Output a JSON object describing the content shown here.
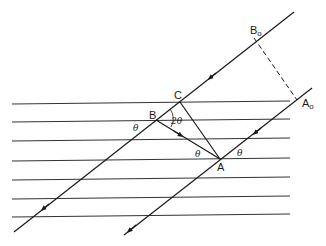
{
  "diagram": {
    "title": "",
    "points": {
      "A": {
        "label": "A",
        "x": 220,
        "y": 159
      },
      "B": {
        "label": "B",
        "x": 156,
        "y": 120
      },
      "C": {
        "label": "C",
        "x": 180,
        "y": 102
      },
      "Ao": {
        "label": "A",
        "sub": "o",
        "x": 297,
        "y": 100
      },
      "Bo": {
        "label": "B",
        "sub": "o",
        "x": 254,
        "y": 38
      }
    },
    "angle_labels": {
      "theta_B": "θ",
      "two_theta": "2θ",
      "theta_A_left": "θ",
      "theta_A_right": "θ"
    },
    "planes": {
      "count": 7,
      "y_positions": [
        104,
        122,
        141,
        160,
        179,
        198,
        217
      ],
      "x_start": 12,
      "x_end": 290
    },
    "rays": [
      {
        "name": "upper-ray",
        "from": [
          294,
          12
        ],
        "to": [
          14,
          232
        ],
        "arrows": [
          [
            212,
            76
          ],
          [
            45,
            207
          ]
        ]
      },
      {
        "name": "lower-ray",
        "from": [
          312,
          88
        ],
        "to": [
          124,
          235
        ],
        "arrows": [
          [
            257,
            131
          ],
          [
            131,
            229
          ]
        ]
      }
    ],
    "segments": [
      {
        "name": "reflected-ray-AB",
        "from": "A",
        "to": "B",
        "arrow": true
      },
      {
        "name": "segment-CA",
        "from": "C",
        "to": "A"
      },
      {
        "name": "wavefront-BoAo",
        "from": "Bo",
        "to": "Ao",
        "dashed": true
      }
    ],
    "colors": {
      "line": "#1a1a1a",
      "background": "#ffffff"
    }
  }
}
